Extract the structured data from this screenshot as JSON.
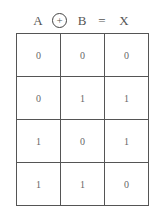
{
  "header": {
    "operand_a": "A",
    "operator_symbol": "+",
    "operator_name": "xor-circled-plus",
    "operand_b": "B",
    "equals": "=",
    "result": "X"
  },
  "truth_table": {
    "columns": [
      "A",
      "B",
      "X"
    ],
    "rows": [
      [
        "0",
        "0",
        "0"
      ],
      [
        "0",
        "1",
        "1"
      ],
      [
        "1",
        "0",
        "1"
      ],
      [
        "1",
        "1",
        "0"
      ]
    ]
  },
  "colors": {
    "background": "#ffffff",
    "line": "#555555",
    "text": "#555555"
  }
}
